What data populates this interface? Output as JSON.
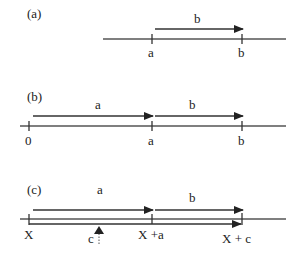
{
  "panels": [
    {
      "id": "a",
      "label": "(a)",
      "vector_labels": [
        "b"
      ],
      "tick_labels": [
        "a",
        "b"
      ]
    },
    {
      "id": "b",
      "label": "(b)",
      "vector_labels": [
        "a",
        "b"
      ],
      "tick_labels": [
        "0",
        "a",
        "b"
      ]
    },
    {
      "id": "c",
      "label": "(c)",
      "vector_labels": [
        "a",
        "b"
      ],
      "tick_labels": [
        "X",
        "X +a",
        "X + c"
      ],
      "pointer_label": "c"
    }
  ],
  "colors": {
    "line": "#444444",
    "text": "#222222",
    "background": "#ffffff"
  }
}
